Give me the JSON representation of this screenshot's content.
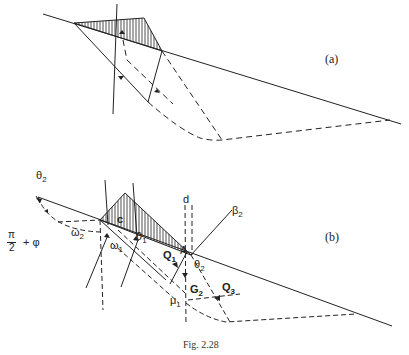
{
  "figure": {
    "caption": "Fig. 2.28",
    "panels": [
      {
        "id": "a",
        "label": "(a)"
      },
      {
        "id": "b",
        "label": "(b)"
      }
    ]
  },
  "labels_b": {
    "theta2_top": {
      "base": "θ",
      "sub": "2"
    },
    "pi2_phi": "π/2 + φ",
    "pi": "π",
    "two": "2",
    "plus_phi": "+ φ",
    "omega2": {
      "base": "ω",
      "sub": "2"
    },
    "omega1": {
      "base": "ω",
      "sub": "1"
    },
    "c": "c",
    "theta1": {
      "base": "θ",
      "sub": "1"
    },
    "d": "d",
    "beta2": {
      "base": "β",
      "sub": "2"
    },
    "A": "A",
    "Q1": {
      "base": "Q",
      "sub": "1"
    },
    "theta2": {
      "base": "θ",
      "sub": "2"
    },
    "G2": {
      "base": "G",
      "sub": "2"
    },
    "Q3": {
      "base": "Q",
      "sub": "3"
    },
    "mu1": {
      "base": "μ",
      "sub": "1"
    }
  },
  "colors": {
    "line": "#222222",
    "background": "#ffffff"
  }
}
